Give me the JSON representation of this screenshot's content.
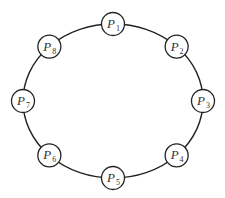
{
  "diagram": {
    "type": "ring-topology",
    "colors": {
      "stroke": "#222222",
      "fill": "#ffffff",
      "text": "#333333"
    },
    "nodes": [
      {
        "id": "P1",
        "letter": "P",
        "sub": "1"
      },
      {
        "id": "P2",
        "letter": "P",
        "sub": "2"
      },
      {
        "id": "P3",
        "letter": "P",
        "sub": "3"
      },
      {
        "id": "P4",
        "letter": "P",
        "sub": "4"
      },
      {
        "id": "P5",
        "letter": "P",
        "sub": "5"
      },
      {
        "id": "P6",
        "letter": "P",
        "sub": "6"
      },
      {
        "id": "P7",
        "letter": "P",
        "sub": "7"
      },
      {
        "id": "P8",
        "letter": "P",
        "sub": "8"
      }
    ],
    "edges": [
      [
        "P1",
        "P2"
      ],
      [
        "P2",
        "P3"
      ],
      [
        "P3",
        "P4"
      ],
      [
        "P4",
        "P5"
      ],
      [
        "P5",
        "P6"
      ],
      [
        "P6",
        "P7"
      ],
      [
        "P7",
        "P8"
      ],
      [
        "P8",
        "P1"
      ]
    ]
  }
}
